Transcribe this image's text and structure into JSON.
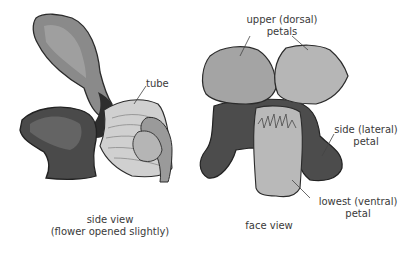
{
  "diagram": {
    "views": [
      {
        "id": "side",
        "caption_line1": "side view",
        "caption_line2": "(flower opened slightly)",
        "labels": [
          {
            "text": "tube"
          }
        ]
      },
      {
        "id": "face",
        "caption_line1": "face view",
        "labels": [
          {
            "line1": "upper (dorsal)",
            "line2": "petals"
          },
          {
            "line1": "side (lateral)",
            "line2": "petal"
          },
          {
            "line1": "lowest (ventral)",
            "line2": "petal"
          }
        ]
      }
    ],
    "colors": {
      "background": "#ffffff",
      "outline": "#2b2b2b",
      "dark_petal": "#4a4a4a",
      "mid_petal": "#7a7a7a",
      "light_petal": "#b8b8b8",
      "leader_line": "#444444",
      "text": "#3a3a3a"
    }
  }
}
